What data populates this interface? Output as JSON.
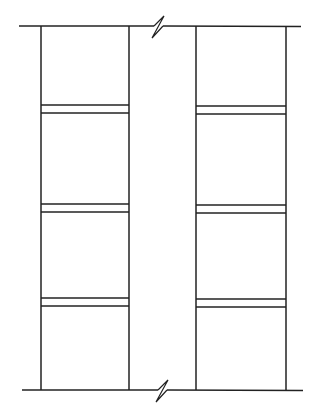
{
  "diagram": {
    "stroke_color": "#222222",
    "background": "#ffffff",
    "top_line": {
      "x1": 19,
      "x2": 301,
      "y": 26
    },
    "bottom_line": {
      "x1": 22,
      "x2": 303,
      "y": 390
    },
    "break_symbols": [
      {
        "position": "top",
        "x": 158,
        "y": 26
      },
      {
        "position": "bottom",
        "x": 162,
        "y": 390
      }
    ],
    "columns": [
      {
        "name": "left",
        "x_left": 41,
        "x_right": 129,
        "joints": [
          [
            105,
            113
          ],
          [
            204,
            212
          ],
          [
            298,
            306
          ]
        ]
      },
      {
        "name": "right",
        "x_left": 196,
        "x_right": 286,
        "joints": [
          [
            106,
            114
          ],
          [
            205,
            213
          ],
          [
            299,
            307
          ]
        ]
      }
    ]
  }
}
